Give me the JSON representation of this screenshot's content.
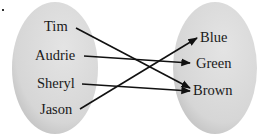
{
  "diagram": {
    "type": "mapping",
    "domain": {
      "items": [
        "Tim",
        "Audrie",
        "Sheryl",
        "Jason"
      ]
    },
    "range": {
      "items": [
        "Blue",
        "Green",
        "Brown"
      ]
    },
    "mappings": [
      {
        "from": "Tim",
        "to": "Brown"
      },
      {
        "from": "Audrie",
        "to": "Green"
      },
      {
        "from": "Sheryl",
        "to": "Brown"
      },
      {
        "from": "Jason",
        "to": "Blue"
      }
    ],
    "colors": {
      "ellipse_fill": "#d9d9d9",
      "ellipse_shade": "#b8b8b8",
      "arrow": "#111111",
      "text": "#1a1a1a"
    }
  }
}
